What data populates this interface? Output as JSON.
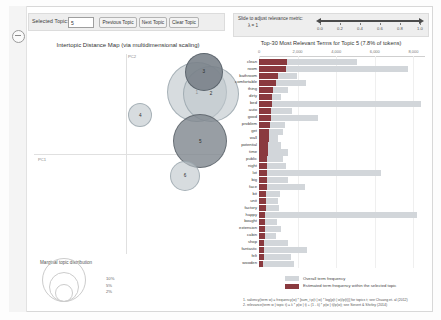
{
  "toolbar": {
    "selected_topic_label": "Selected Topic:",
    "topic_value": "5",
    "previous_button": "Previous Topic",
    "next_button": "Next Topic",
    "clear_button": "Clear Topic"
  },
  "slider": {
    "label": "Slide to adjust relevance metric:",
    "lambda_label": "λ = 1",
    "ticks": [
      "0.0",
      "0.2",
      "0.4",
      "0.6",
      "0.8",
      "1.0"
    ],
    "value": 1.0
  },
  "left_panel": {
    "title": "Intertopic Distance Map (via multidimensional scaling)",
    "x_axis_label": "PC1",
    "y_axis_label": "PC2",
    "legend_title": "Marginal topic distribution",
    "legend_sizes": [
      "2%",
      "5%",
      "10%"
    ]
  },
  "right_panel": {
    "title": "Top-30 Most Relevant Terms for Topic 5 (7.8% of tokens)",
    "axis_ticks": [
      "0",
      "2,000",
      "4,000",
      "6,000",
      "8,000"
    ],
    "legend": [
      "Overall term frequency",
      "Estimated term frequency within the selected topic"
    ],
    "notes": [
      "1. saliency(term w) = frequency(w) * [sum_t p(t | w) * log(p(t | w)/p(t))] for topics t; see Chuang et. al (2012)",
      "2. relevance(term w | topic t) = λ * p(w | t) + (1 - λ) * p(w | t)/p(w); see Sievert & Shirley (2014)"
    ]
  },
  "colors": {
    "bar_total": "#d2d6da",
    "bar_topic": "#8a3a3f",
    "bubble_fill": "#bec6cc",
    "bubble_selected": "#7e868d",
    "panel_bg": "#eeeeee"
  },
  "chart_data": {
    "intertopic_map": {
      "type": "scatter",
      "title": "Intertopic Distance Map (via multidimensional scaling)",
      "xlabel": "PC1",
      "ylabel": "PC2",
      "selected_topic": 5,
      "topics": [
        {
          "id": 1,
          "x": 0.6,
          "y": 0.57,
          "size": 30,
          "selected": false
        },
        {
          "id": 2,
          "x": 0.72,
          "y": 0.56,
          "size": 28,
          "selected": false
        },
        {
          "id": 3,
          "x": 0.66,
          "y": 0.76,
          "size": 19,
          "selected": false
        },
        {
          "id": 4,
          "x": 0.12,
          "y": 0.36,
          "size": 12,
          "selected": false
        },
        {
          "id": 5,
          "x": 0.63,
          "y": 0.12,
          "size": 27,
          "selected": true
        },
        {
          "id": 6,
          "x": 0.5,
          "y": -0.2,
          "size": 15,
          "selected": false
        }
      ]
    },
    "term_bars": {
      "type": "bar",
      "orientation": "horizontal",
      "title": "Top-30 Most Relevant Terms for Topic 5 (7.8% of tokens)",
      "xlim": [
        0,
        8600
      ],
      "xticks": [
        0,
        2000,
        4000,
        6000,
        8000
      ],
      "series": [
        {
          "name": "Overall term frequency",
          "color": "#d2d6da"
        },
        {
          "name": "Estimated term frequency within the selected topic",
          "color": "#8a3a3f"
        }
      ],
      "terms": [
        {
          "term": "clean",
          "total": 5100,
          "topic": 1450
        },
        {
          "term": "room",
          "total": 7700,
          "topic": 1420
        },
        {
          "term": "bathroom",
          "total": 1950,
          "topic": 1010
        },
        {
          "term": "comfortable",
          "total": 2450,
          "topic": 880
        },
        {
          "term": "thing",
          "total": 1500,
          "topic": 700
        },
        {
          "term": "dirty",
          "total": 1150,
          "topic": 690
        },
        {
          "term": "bed",
          "total": 8400,
          "topic": 660
        },
        {
          "term": "auto",
          "total": 1700,
          "topic": 640
        },
        {
          "term": "good",
          "total": 3050,
          "topic": 620
        },
        {
          "term": "problem",
          "total": 1350,
          "topic": 560
        },
        {
          "term": "get",
          "total": 1250,
          "topic": 520
        },
        {
          "term": "wall",
          "total": 1000,
          "topic": 500
        },
        {
          "term": "potential",
          "total": 1150,
          "topic": 480
        },
        {
          "term": "time",
          "total": 1500,
          "topic": 450
        },
        {
          "term": "public",
          "total": 1250,
          "topic": 440
        },
        {
          "term": "night",
          "total": 1400,
          "topic": 430
        },
        {
          "term": "lot",
          "total": 6300,
          "topic": 420
        },
        {
          "term": "big",
          "total": 1500,
          "topic": 400
        },
        {
          "term": "face",
          "total": 2400,
          "topic": 390
        },
        {
          "term": "bit",
          "total": 1100,
          "topic": 370
        },
        {
          "term": "unit",
          "total": 1000,
          "topic": 360
        },
        {
          "term": "factory",
          "total": 1050,
          "topic": 340
        },
        {
          "term": "happy",
          "total": 8200,
          "topic": 330
        },
        {
          "term": "bought",
          "total": 950,
          "topic": 320
        },
        {
          "term": "extension",
          "total": 1150,
          "topic": 310
        },
        {
          "term": "cabin",
          "total": 900,
          "topic": 300
        },
        {
          "term": "shop",
          "total": 1500,
          "topic": 280
        },
        {
          "term": "fantastic",
          "total": 2500,
          "topic": 270
        },
        {
          "term": "felt",
          "total": 1650,
          "topic": 250
        },
        {
          "term": "wooden",
          "total": 1800,
          "topic": 230
        }
      ]
    }
  }
}
